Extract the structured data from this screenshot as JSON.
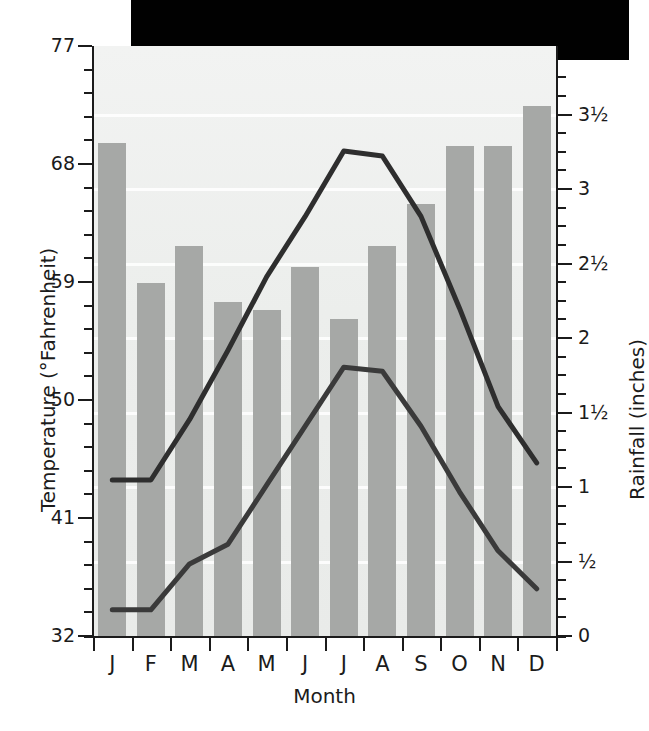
{
  "chart_data": {
    "type": "bar",
    "title": "",
    "xlabel": "Month",
    "categories": [
      "J",
      "F",
      "M",
      "A",
      "M",
      "J",
      "J",
      "A",
      "S",
      "O",
      "N",
      "D"
    ],
    "month_names": [
      "January",
      "February",
      "March",
      "April",
      "May",
      "June",
      "July",
      "August",
      "September",
      "October",
      "November",
      "December"
    ],
    "grid": true,
    "legend": "none",
    "axes": {
      "left": {
        "label": "Temperature (°Fahrenheit)",
        "unit": "°F",
        "min": 32,
        "max": 77,
        "major_ticks": [
          32,
          41,
          50,
          59,
          68,
          77
        ],
        "major_tick_labels": [
          "32",
          "41",
          "50",
          "59",
          "68",
          "77"
        ],
        "minor_tick_step": 1.8
      },
      "right": {
        "label": "Rainfall (inches)",
        "unit": "inches",
        "min": 0,
        "max": 3.96,
        "major_ticks": [
          0,
          0.5,
          1,
          1.5,
          2,
          2.5,
          3,
          3.5
        ],
        "major_tick_labels": [
          "0",
          "½",
          "1",
          "1½",
          "2",
          "2½",
          "3",
          "3½"
        ],
        "minor_tick_step": 0.125
      }
    },
    "series": [
      {
        "name": "Rainfall",
        "type": "bar",
        "axis": "right",
        "unit": "inches",
        "color": "#a6a8a6",
        "values": [
          3.31,
          2.37,
          2.62,
          2.24,
          2.19,
          2.48,
          2.13,
          2.62,
          2.9,
          3.29,
          3.29,
          3.56
        ]
      },
      {
        "name": "Average high temperature",
        "type": "line",
        "axis": "left",
        "unit": "°F",
        "color": "#2e2e2e",
        "values": [
          43.9,
          43.9,
          48.5,
          53.8,
          59.4,
          64.0,
          69.0,
          68.6,
          64.0,
          57.0,
          49.5,
          45.2
        ]
      },
      {
        "name": "Average low temperature",
        "type": "line",
        "axis": "left",
        "unit": "°F",
        "color": "#3a3a3a",
        "values": [
          34.0,
          34.0,
          37.5,
          39.0,
          43.5,
          48.0,
          52.5,
          52.2,
          48.0,
          43.0,
          38.5,
          35.6
        ]
      }
    ]
  },
  "chart_meta": {
    "x_axis_title": "Month",
    "y_axis_title_left": "Temperature (°Fahrenheit)",
    "y_axis_title_right": "Rainfall (inches)"
  }
}
